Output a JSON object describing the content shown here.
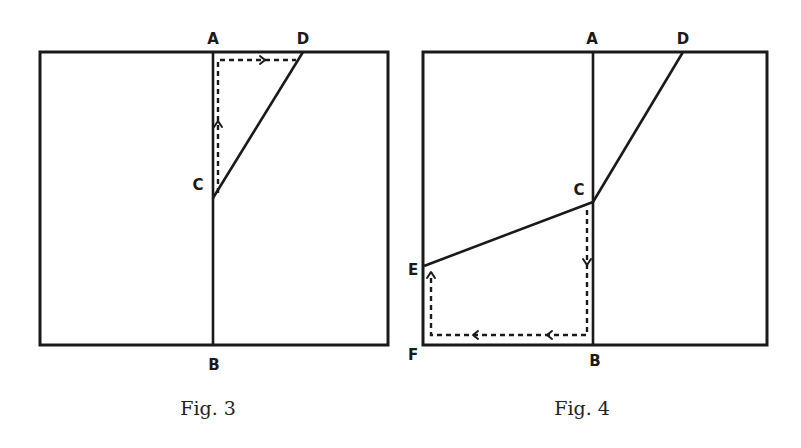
{
  "figures": [
    {
      "caption": "Fig. 3",
      "labels": {
        "A": "A",
        "B": "B",
        "C": "C",
        "D": "D"
      }
    },
    {
      "caption": "Fig. 4",
      "labels": {
        "A": "A",
        "B": "B",
        "C": "C",
        "D": "D",
        "E": "E",
        "F": "F"
      }
    }
  ]
}
